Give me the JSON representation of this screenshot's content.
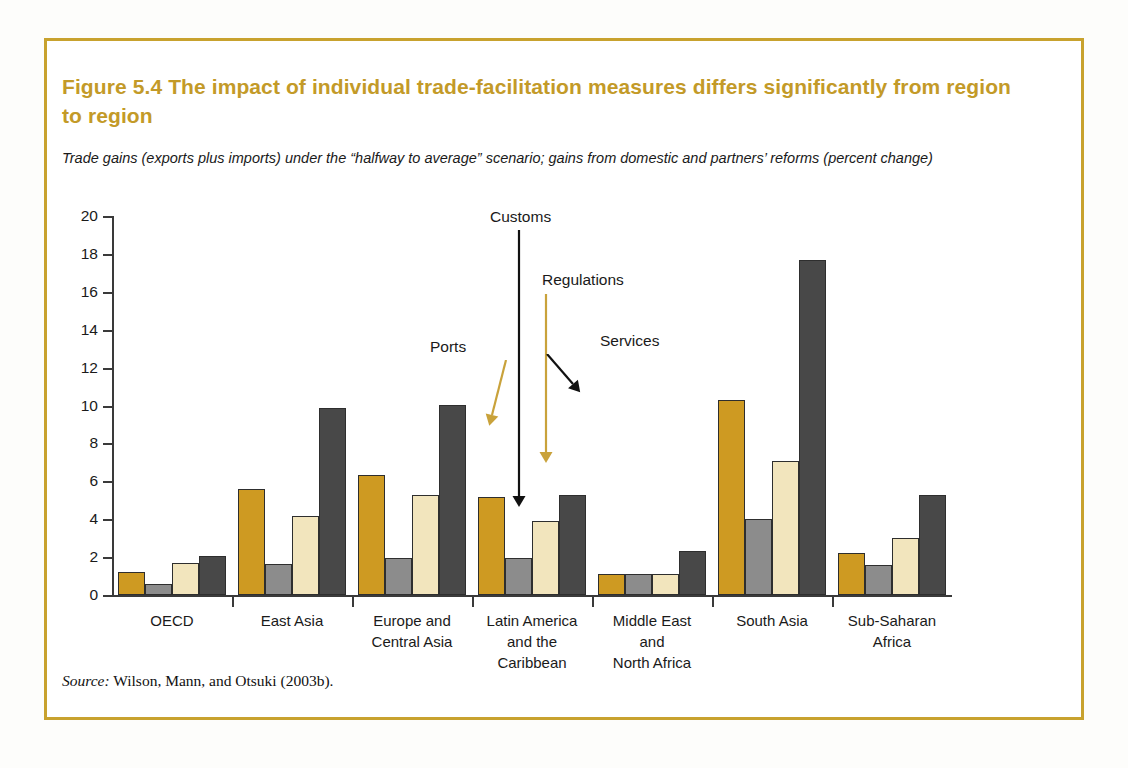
{
  "figure": {
    "title": "Figure 5.4  The impact of individual trade-facilitation measures differs significantly from region to region",
    "subtitle": "Trade gains (exports plus imports) under the “halfway to average” scenario; gains from domestic and partners’ reforms (percent change)",
    "source_word": "Source:",
    "source_text": " Wilson, Mann, and Otsuki (2003b).",
    "frame_color": "#c8a22e",
    "title_color": "#c39a28"
  },
  "chart_data": {
    "type": "bar",
    "title": "Figure 5.4  The impact of individual trade-facilitation measures differs significantly from region to region",
    "subtitle": "Trade gains (exports plus imports) under the “halfway to average” scenario; gains from domestic and partners’ reforms (percent change)",
    "xlabel": "",
    "ylabel": "",
    "ylim": [
      0,
      20
    ],
    "yticks": [
      0,
      2,
      4,
      6,
      8,
      10,
      12,
      14,
      16,
      18,
      20
    ],
    "grid": false,
    "legend": "annotated-arrows",
    "categories": [
      "OECD",
      "East Asia",
      "Europe and Central Asia",
      "Latin America and the Caribbean",
      "Middle East and North Africa",
      "South Asia",
      "Sub-Saharan Africa"
    ],
    "category_lines": [
      [
        "OECD"
      ],
      [
        "East Asia"
      ],
      [
        "Europe and",
        "Central Asia"
      ],
      [
        "Latin America",
        "and the",
        "Caribbean"
      ],
      [
        "Middle East",
        "and",
        "North Africa"
      ],
      [
        "South Asia"
      ],
      [
        "Sub-Saharan",
        "Africa"
      ]
    ],
    "series": [
      {
        "name": "Ports",
        "color": "#ce9a22",
        "values": [
          1.2,
          5.6,
          6.35,
          5.15,
          1.1,
          10.3,
          2.2
        ]
      },
      {
        "name": "Customs",
        "color": "#8c8c8c",
        "values": [
          0.6,
          1.65,
          1.95,
          1.95,
          1.1,
          4.0,
          1.6
        ]
      },
      {
        "name": "Regulations",
        "color": "#f2e5bd",
        "values": [
          1.7,
          4.15,
          5.3,
          3.9,
          1.1,
          7.05,
          3.0
        ]
      },
      {
        "name": "Services",
        "color": "#484848",
        "values": [
          2.05,
          9.85,
          10.05,
          5.3,
          2.3,
          17.7,
          5.3
        ]
      }
    ],
    "annotations": [
      {
        "label": "Ports",
        "arrow_color": "#c9a23b",
        "target_series": "Ports"
      },
      {
        "label": "Customs",
        "arrow_color": "#111111",
        "target_series": "Customs"
      },
      {
        "label": "Regulations",
        "arrow_color": "#c9a23b",
        "target_series": "Regulations"
      },
      {
        "label": "Services",
        "arrow_color": "#111111",
        "target_series": "Services"
      }
    ]
  }
}
